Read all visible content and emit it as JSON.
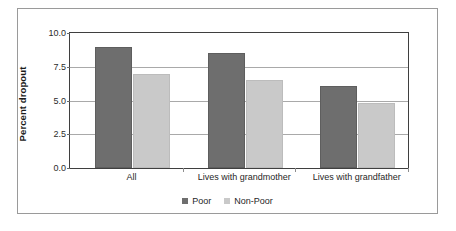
{
  "chart_data": {
    "type": "bar",
    "title": "",
    "subtitle": "",
    "xlabel": "",
    "ylabel": "Percent dropout",
    "ylim": [
      0.0,
      10.0
    ],
    "ytick_labels": [
      "10.0",
      "7.5",
      "5.0",
      "2.5",
      "0.0"
    ],
    "ytick_values": [
      10.0,
      7.5,
      5.0,
      2.5,
      0.0
    ],
    "grid": true,
    "legend_position": "bottom-center",
    "categories": [
      "All",
      "Lives with grandmother",
      "Lives with grandfather"
    ],
    "series": [
      {
        "name": "Poor",
        "color": "#6e6e6e",
        "values": [
          9.0,
          8.5,
          6.1
        ]
      },
      {
        "name": "Non-Poor",
        "color": "#c9c9c9",
        "values": [
          7.0,
          6.5,
          4.8
        ]
      }
    ]
  },
  "axis": {
    "y_title": "Percent dropout",
    "ticks": [
      {
        "label": "10.0",
        "value": 10.0
      },
      {
        "label": "7.5",
        "value": 7.5
      },
      {
        "label": "5.0",
        "value": 5.0
      },
      {
        "label": "2.5",
        "value": 2.5
      },
      {
        "label": "0.0",
        "value": 0.0
      }
    ]
  },
  "categories": [
    {
      "label": "All"
    },
    {
      "label": "Lives with grandmother"
    },
    {
      "label": "Lives with grandfather"
    }
  ],
  "legend": {
    "items": [
      {
        "label": "Poor",
        "color": "#6e6e6e"
      },
      {
        "label": "Non-Poor",
        "color": "#c9c9c9"
      }
    ]
  },
  "colors": {
    "poor": "#6e6e6e",
    "non_poor": "#c9c9c9",
    "gridline": "#a9a9a9",
    "axis": "#3f3f3f",
    "frame": "#9a9a9a",
    "text": "#1f1f1f"
  }
}
